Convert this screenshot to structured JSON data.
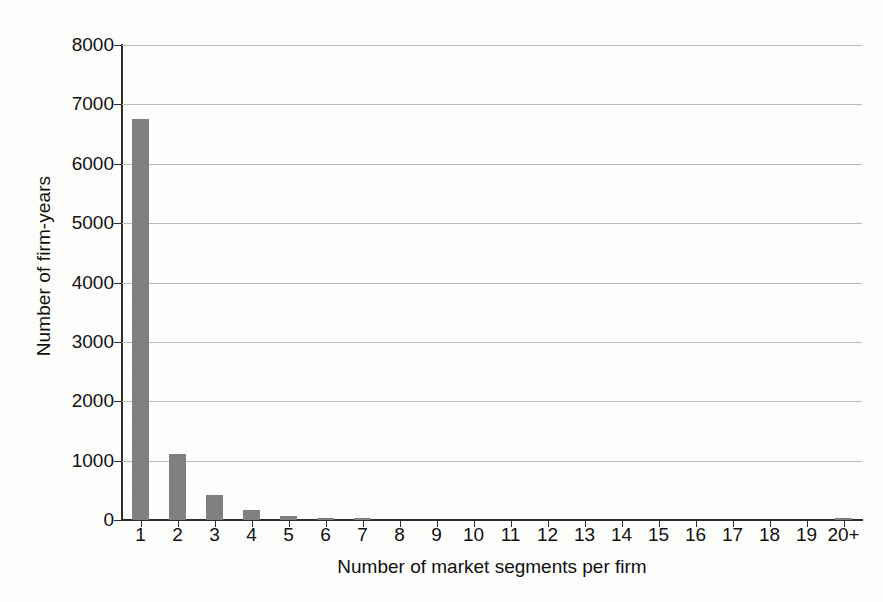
{
  "chart_data": {
    "type": "bar",
    "title": "",
    "xlabel": "Number of market segments per firm",
    "ylabel": "Number of firm-years",
    "categories": [
      "1",
      "2",
      "3",
      "4",
      "5",
      "6",
      "7",
      "8",
      "9",
      "10",
      "11",
      "12",
      "13",
      "14",
      "15",
      "16",
      "17",
      "18",
      "19",
      "20+"
    ],
    "values": [
      6750,
      1120,
      420,
      170,
      65,
      30,
      28,
      5,
      3,
      2,
      2,
      1,
      1,
      1,
      1,
      1,
      1,
      0,
      0,
      35
    ],
    "ylim": [
      0,
      8000
    ],
    "ytick_labels": [
      "8000",
      "7000",
      "6000",
      "5000",
      "4000",
      "3000",
      "2000",
      "1000",
      "0"
    ],
    "ytick_values": [
      8000,
      7000,
      6000,
      5000,
      4000,
      3000,
      2000,
      1000,
      0
    ],
    "grid": true,
    "grid_axis": "y",
    "legend": "none",
    "bar_color": "#7e7e7e",
    "axis_color": "#2b2b2b",
    "gridline_color": "#b9b9b9",
    "background_color": "#fdfdfc"
  }
}
